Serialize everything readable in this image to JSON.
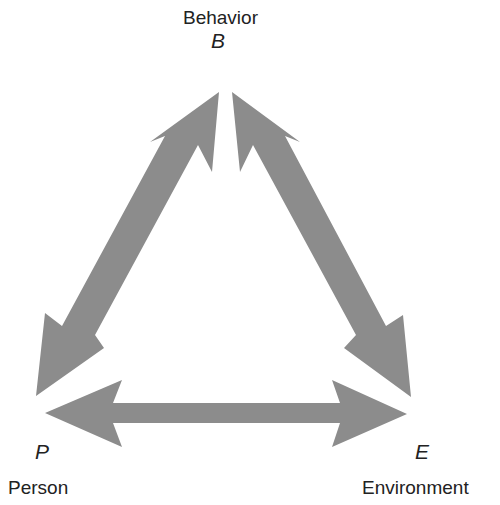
{
  "diagram": {
    "type": "triadic reciprocal causation",
    "arrow_color": "#8c8c8c",
    "nodes": {
      "behavior": {
        "label": "Behavior",
        "symbol": "B"
      },
      "person": {
        "label": "Person",
        "symbol": "P"
      },
      "environment": {
        "label": "Environment",
        "symbol": "E"
      }
    },
    "edges": [
      {
        "from": "B",
        "to": "P",
        "bidirectional": true
      },
      {
        "from": "B",
        "to": "E",
        "bidirectional": true
      },
      {
        "from": "P",
        "to": "E",
        "bidirectional": true
      }
    ]
  }
}
